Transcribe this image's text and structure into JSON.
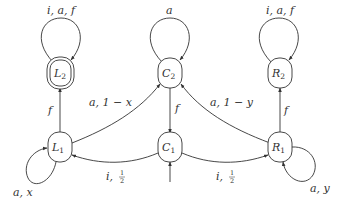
{
  "diagram": {
    "type": "state-machine",
    "nodes": [
      {
        "id": "L2",
        "base": "L",
        "sub": "2",
        "accepting": true
      },
      {
        "id": "C2",
        "base": "C",
        "sub": "2",
        "accepting": false
      },
      {
        "id": "R2",
        "base": "R",
        "sub": "2",
        "accepting": false
      },
      {
        "id": "L1",
        "base": "L",
        "sub": "1",
        "accepting": false
      },
      {
        "id": "C1",
        "base": "C",
        "sub": "1",
        "accepting": false,
        "initial": true
      },
      {
        "id": "R1",
        "base": "R",
        "sub": "1",
        "accepting": false
      }
    ],
    "edges": [
      {
        "from": "L2",
        "to": "L2",
        "label": "i, a, f"
      },
      {
        "from": "C2",
        "to": "C2",
        "label": "a"
      },
      {
        "from": "R2",
        "to": "R2",
        "label": "i, a, f"
      },
      {
        "from": "L1",
        "to": "L2",
        "label": "f"
      },
      {
        "from": "L1",
        "to": "C2",
        "label": "a, 1 − x"
      },
      {
        "from": "C2",
        "to": "C1",
        "label": "f"
      },
      {
        "from": "R1",
        "to": "C2",
        "label": "a, 1 − y"
      },
      {
        "from": "R1",
        "to": "R2",
        "label": "f"
      },
      {
        "from": "C1",
        "to": "L1",
        "label_prefix": "i, ",
        "frac_num": "1",
        "frac_den": "2"
      },
      {
        "from": "C1",
        "to": "R1",
        "label_prefix": "i, ",
        "frac_num": "1",
        "frac_den": "2"
      },
      {
        "from": "L1",
        "to": "L1",
        "label": "a, x"
      },
      {
        "from": "R1",
        "to": "R1",
        "label": "a, y"
      }
    ]
  }
}
